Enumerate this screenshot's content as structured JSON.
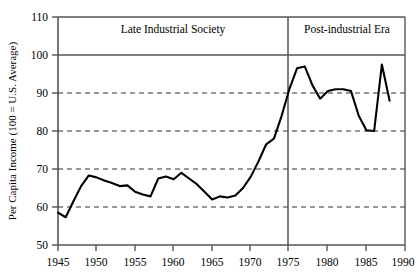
{
  "chart_data": {
    "type": "line",
    "title": "",
    "xlabel": "",
    "ylabel": "Per Capita Income (100 = U.S. Average)",
    "xlim": [
      1945,
      1990
    ],
    "ylim": [
      50,
      110
    ],
    "ytick_labels": [
      "50",
      "60",
      "70",
      "80",
      "90",
      "100",
      "110"
    ],
    "ytick_values": [
      50,
      60,
      70,
      80,
      90,
      100,
      110
    ],
    "xtick_labels": [
      "1945",
      "1950",
      "1955",
      "1960",
      "1965",
      "1970",
      "1975",
      "1980",
      "1985",
      "1990"
    ],
    "xtick_values": [
      1945,
      1950,
      1955,
      1960,
      1965,
      1970,
      1975,
      1980,
      1985,
      1990
    ],
    "grid": "horizontal dashed gridlines at 60, 70, 80, 90; solid reference line at 100",
    "solid_reference_line": 100,
    "dashed_gridlines": [
      60,
      70,
      80,
      90
    ],
    "legend": "none",
    "annotations": [
      {
        "name": "era-divider",
        "x": 1975,
        "style": "solid vertical line"
      },
      {
        "name": "era-label-left",
        "text": "Late Industrial Society",
        "x_center": 1960
      },
      {
        "name": "era-label-right",
        "text": "Post-industrial Era",
        "x_center": 1982.5
      }
    ],
    "x": [
      1945,
      1946,
      1947,
      1948,
      1949,
      1950,
      1951,
      1952,
      1953,
      1954,
      1955,
      1956,
      1957,
      1958,
      1959,
      1960,
      1961,
      1962,
      1963,
      1964,
      1965,
      1966,
      1967,
      1968,
      1969,
      1970,
      1971,
      1972,
      1973,
      1974,
      1975,
      1976,
      1977,
      1978,
      1979,
      1980,
      1981,
      1982,
      1983,
      1984,
      1985,
      1986,
      1987,
      1988
    ],
    "values": [
      58.5,
      57.3,
      61.5,
      65.5,
      68.3,
      67.8,
      67.0,
      66.3,
      65.5,
      65.7,
      64.0,
      63.3,
      62.8,
      67.5,
      68.0,
      67.3,
      69.0,
      67.5,
      66.0,
      64.0,
      62.0,
      62.8,
      62.5,
      63.0,
      65.0,
      68.0,
      72.0,
      76.5,
      78.0,
      84.0,
      91.0,
      96.5,
      97.0,
      92.0,
      88.5,
      90.5,
      91.0,
      91.0,
      90.5,
      84.0,
      80.2,
      80.0,
      97.5,
      88.0
    ],
    "series_name": "Per Capita Income Index"
  },
  "chart": {
    "ylabel": "Per Capita Income (100 = U.S. Average)",
    "eras": [
      {
        "label": "Late Industrial Society"
      },
      {
        "label": "Post-industrial Era"
      }
    ],
    "ytick_labels": [
      "110",
      "100",
      "90",
      "80",
      "70",
      "60",
      "50"
    ],
    "xtick_labels": [
      "1945",
      "1950",
      "1955",
      "1960",
      "1965",
      "1970",
      "1975",
      "1980",
      "1985",
      "1990"
    ]
  },
  "colors": {
    "line": "#000000",
    "axis": "#555555",
    "grid": "#444444",
    "background": "#ffffff"
  }
}
